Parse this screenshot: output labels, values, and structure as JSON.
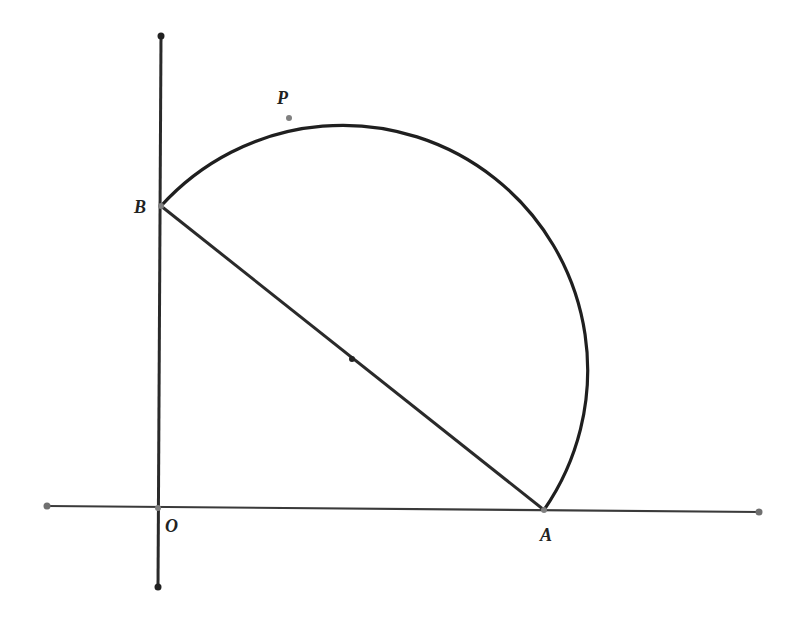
{
  "figure": {
    "colors": {
      "stroke": "#2a2a2a",
      "axis": "#3a3a3a",
      "point_fill": "#808080"
    },
    "axes": {
      "x_axis": {
        "x1": 47,
        "y1": 506,
        "x2": 759,
        "y2": 512
      },
      "y_axis": {
        "x1": 161,
        "y1": 36,
        "x2": 158,
        "y2": 587
      }
    },
    "points": {
      "O": {
        "label": "O",
        "x": 158,
        "y": 508
      },
      "A": {
        "label": "A",
        "x": 544,
        "y": 510
      },
      "B": {
        "label": "B",
        "x": 161,
        "y": 206
      },
      "P": {
        "label": "P",
        "x": 289,
        "y": 118
      },
      "M": {
        "label": "",
        "x": 352,
        "y": 359
      }
    },
    "segments": [
      {
        "from": "B",
        "to": "A"
      }
    ],
    "arc": {
      "description": "semicircle with diameter AB through P",
      "from": "B",
      "to": "A",
      "center": "M"
    }
  }
}
